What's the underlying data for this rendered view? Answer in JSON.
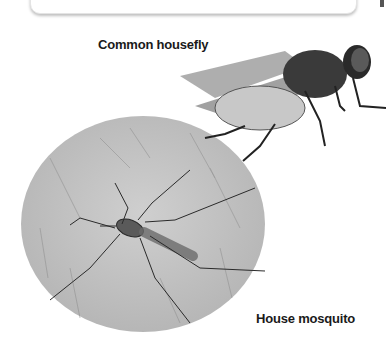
{
  "page": {
    "top_box": {
      "visible": true
    },
    "figures": [
      {
        "id": "housefly",
        "label": "Common housefly",
        "icon": "housefly-photo"
      },
      {
        "id": "mosquito",
        "label": "House mosquito",
        "icon": "mosquito-on-skin-photo"
      }
    ]
  },
  "colors": {
    "text": "#1a1a1a",
    "skin_bg": "#bdbdbd",
    "insect": "#2a2a2a"
  }
}
